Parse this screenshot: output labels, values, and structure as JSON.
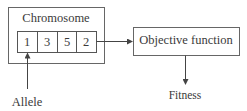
{
  "diagram": {
    "chromosome_box": {
      "title": "Chromosome",
      "genes": [
        "1",
        "3",
        "5",
        "2"
      ]
    },
    "objective_box": {
      "label": "Objective function"
    },
    "output_label": "Fitness",
    "allele_label": "Allele",
    "colors": {
      "stroke": "#555555",
      "text": "#3a3a3a",
      "background": "#ffffff"
    },
    "edges": [
      {
        "from": "chromosome",
        "to": "objective-function"
      },
      {
        "from": "objective-function",
        "to": "fitness"
      },
      {
        "from": "allele-label",
        "to": "gene-1"
      }
    ]
  }
}
